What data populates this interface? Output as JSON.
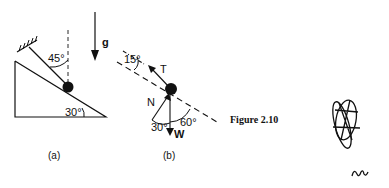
{
  "figure": {
    "caption": "Figure 2.10",
    "panel_a": {
      "label": "(a)",
      "angle_string": "45°",
      "angle_incline": "30°",
      "gravity_label": "g"
    },
    "panel_b": {
      "label": "(b)",
      "angle_tension": "15°",
      "tension_label": "T",
      "normal_label": "N",
      "weight_label": "W",
      "angle_normal": "30°",
      "angle_weight": "60°"
    }
  }
}
